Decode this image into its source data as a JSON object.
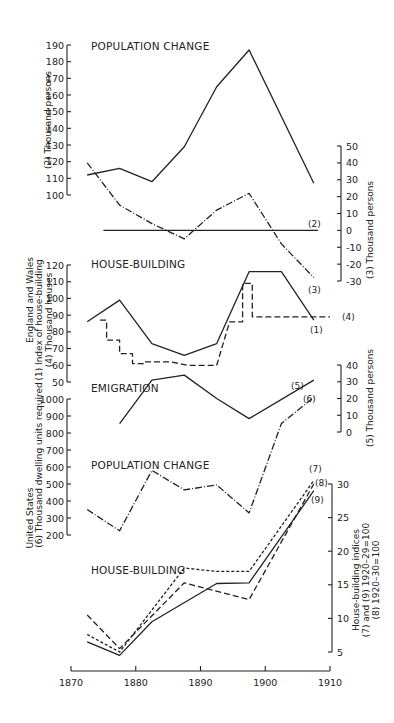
{
  "chart_data": [
    {
      "type": "line",
      "title": "POPULATION CHANGE",
      "region": "England and Wales",
      "xlabel": "",
      "xlim": [
        1870,
        1910
      ],
      "axes": {
        "left": {
          "label": "(2) Thousand persons",
          "ylim": [
            100,
            190
          ],
          "ticks": [
            100,
            110,
            120,
            130,
            140,
            150,
            160,
            170,
            180,
            190
          ]
        },
        "right": {
          "label": "(3) Thousand persons",
          "ylim": [
            -30,
            50
          ],
          "ticks": [
            -30,
            -20,
            -10,
            0,
            10,
            20,
            30,
            40,
            50
          ]
        }
      },
      "series": [
        {
          "name": "(2)",
          "axis": "left",
          "style": "solid",
          "x": [
            1872.5,
            1877.5,
            1882.5,
            1887.5,
            1892.5,
            1897.5,
            1907.5
          ],
          "y": [
            112,
            116,
            108,
            129,
            165,
            187,
            107
          ]
        },
        {
          "name": "(3)",
          "axis": "right",
          "style": "dashdot",
          "x": [
            1872.5,
            1877.5,
            1882.5,
            1887.5,
            1892.5,
            1897.5,
            1902.5,
            1907.5
          ],
          "y": [
            40,
            15,
            4,
            -5,
            12,
            22,
            -8,
            -28
          ]
        }
      ],
      "reference_line": {
        "axis": "right",
        "y": 0,
        "x": [
          1875,
          1910
        ]
      }
    },
    {
      "type": "line",
      "title": "HOUSE-BUILDING",
      "region": "England and Wales",
      "xlim": [
        1870,
        1910
      ],
      "axes": {
        "left": {
          "label": "(1) Index of house-building\n(4) Thousand houses",
          "ylim": [
            50,
            120
          ],
          "ticks": [
            50,
            60,
            70,
            80,
            90,
            100,
            110,
            120
          ]
        }
      },
      "series": [
        {
          "name": "(1)",
          "axis": "left",
          "style": "solid",
          "x": [
            1872.5,
            1877.5,
            1882.5,
            1887.5,
            1892.5,
            1897.5,
            1902.5,
            1907.5
          ],
          "y": [
            86,
            99,
            73,
            66,
            73,
            116,
            116,
            87
          ]
        },
        {
          "name": "(4)",
          "axis": "left",
          "style": "dashed-step",
          "x": [
            1874.5,
            1875.5,
            1875.5,
            1877.5,
            1877.5,
            1879.5,
            1879.5,
            1881.5,
            1881.5,
            1885.5,
            1888,
            1888,
            1892,
            1892.5,
            1894.5,
            1896.5,
            1896.5,
            1898,
            1898,
            1903,
            1903,
            1910
          ],
          "y": [
            87,
            87,
            75,
            75,
            67,
            67,
            61,
            61,
            62,
            62,
            60,
            60,
            60,
            60,
            86,
            86,
            109,
            109,
            89,
            89,
            89,
            89
          ]
        }
      ]
    },
    {
      "type": "line",
      "title": "EMIGRATION",
      "region": "England and Wales",
      "xlim": [
        1870,
        1910
      ],
      "axes": {
        "right": {
          "label": "(5) Thousand persons",
          "ylim": [
            0,
            40
          ],
          "ticks": [
            0,
            10,
            20,
            30,
            40
          ]
        }
      },
      "series": [
        {
          "name": "(5)",
          "axis": "right",
          "style": "solid",
          "x": [
            1877.5,
            1882.5,
            1887.5,
            1892.5,
            1897.5,
            1907.5
          ],
          "y": [
            5,
            31,
            34,
            20,
            8,
            31
          ]
        }
      ]
    },
    {
      "type": "line",
      "title": "POPULATION CHANGE",
      "region": "United States",
      "xlim": [
        1870,
        1910
      ],
      "axes": {
        "left": {
          "label": "(6) Thousand dwelling units required",
          "ylim": [
            200,
            1000
          ],
          "ticks": [
            200,
            300,
            400,
            500,
            600,
            700,
            800,
            900,
            1000
          ]
        }
      },
      "series": [
        {
          "name": "(6)",
          "axis": "left",
          "style": "dashdot",
          "x": [
            1872.5,
            1877.5,
            1882.5,
            1887.5,
            1892.5,
            1897.5,
            1902.5,
            1907.5
          ],
          "y": [
            350,
            225,
            580,
            465,
            495,
            330,
            855,
            1010
          ]
        }
      ]
    },
    {
      "type": "line",
      "title": "HOUSE-BUILDING",
      "region": "United States",
      "xlim": [
        1870,
        1910
      ],
      "axes": {
        "right": {
          "label": "House-building indices\n(7) and (9) 1920-29=100\n(8) 1920-30=100",
          "ylim": [
            5,
            30
          ],
          "ticks": [
            5,
            10,
            15,
            20,
            25,
            30
          ]
        }
      },
      "series": [
        {
          "name": "(7)",
          "axis": "right",
          "style": "dotted-dash",
          "x": [
            1872.5,
            1877.5,
            1887.5,
            1892.5,
            1897.5,
            1907.5
          ],
          "y": [
            7.6,
            5.0,
            17.5,
            17.0,
            17.0,
            30.5
          ]
        },
        {
          "name": "(8)",
          "axis": "right",
          "style": "dashed",
          "x": [
            1872.5,
            1877.5,
            1887.5,
            1897.5,
            1907.5
          ],
          "y": [
            10.5,
            5.5,
            15.3,
            12.8,
            30.0
          ]
        },
        {
          "name": "(9)",
          "axis": "right",
          "style": "solid",
          "x": [
            1872.5,
            1877.5,
            1882.5,
            1892.5,
            1897.5,
            1907.5
          ],
          "y": [
            6.5,
            4.5,
            9.5,
            15.2,
            15.3,
            29.0
          ]
        }
      ]
    }
  ],
  "labels": {
    "region_ew": "England and Wales",
    "region_us": "United States",
    "title_pop_ew": "POPULATION CHANGE",
    "title_house_ew": "HOUSE-BUILDING",
    "title_emig": "EMIGRATION",
    "title_pop_us": "POPULATION CHANGE",
    "title_house_us": "HOUSE-BUILDING",
    "axis_2": "(2) Thousand persons",
    "axis_3": "(3) Thousand persons",
    "axis_1_line1": "(1) Index of house-building",
    "axis_1_line2": "(4) Thousand houses",
    "axis_5": "(5) Thousand persons",
    "axis_6": "(6) Thousand dwelling units required",
    "axis_789_line1": "House-building indices",
    "axis_789_line2": "(7) and (9) 1920–29=100",
    "axis_789_line3": "(8) 1920–30=100",
    "s1": "(1)",
    "s2": "(2)",
    "s3": "(3)",
    "s4": "(4)",
    "s5": "(5)",
    "s6": "(6)",
    "s7": "(7)",
    "s8": "(8)",
    "s9": "(9)"
  },
  "x_axis": {
    "ticks": [
      1870,
      1880,
      1890,
      1900,
      1910
    ]
  }
}
